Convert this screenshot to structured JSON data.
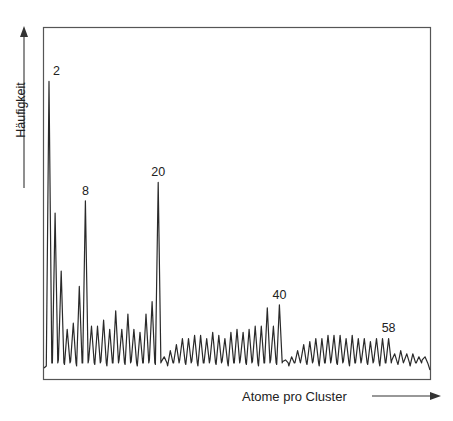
{
  "chart_data": {
    "type": "line",
    "title": "",
    "xlabel": "Atome pro Cluster",
    "ylabel": "Häufigkeit",
    "grid": false,
    "legend": null,
    "annotations": [
      {
        "label": "2",
        "note": "tallest peak at far left"
      },
      {
        "label": "8",
        "note": "magic-number peak"
      },
      {
        "label": "20",
        "note": "magic-number peak, followed by sharp drop"
      },
      {
        "label": "40",
        "note": "peak followed by drop"
      },
      {
        "label": "58",
        "note": "peak followed by drop"
      }
    ],
    "x_range": [
      1,
      66
    ],
    "y_range": [
      0,
      1
    ],
    "series": [
      {
        "name": "Häufigkeit",
        "description": "Relative abundance of clusters by number of atoms per cluster; pronounced peaks at 2, 8, 20, 40, 58",
        "x": [
          2,
          3,
          4,
          5,
          6,
          7,
          8,
          9,
          10,
          11,
          12,
          13,
          14,
          15,
          16,
          17,
          18,
          19,
          20,
          21,
          22,
          23,
          24,
          25,
          26,
          27,
          28,
          29,
          30,
          31,
          32,
          33,
          34,
          35,
          36,
          37,
          38,
          39,
          40,
          41,
          42,
          43,
          44,
          45,
          46,
          47,
          48,
          49,
          50,
          51,
          52,
          53,
          54,
          55,
          56,
          57,
          58,
          59,
          60,
          61,
          62,
          63,
          64
        ],
        "values": [
          0.93,
          0.5,
          0.31,
          0.12,
          0.14,
          0.26,
          0.54,
          0.13,
          0.13,
          0.15,
          0.12,
          0.18,
          0.12,
          0.17,
          0.12,
          0.11,
          0.17,
          0.21,
          0.6,
          0.03,
          0.05,
          0.07,
          0.09,
          0.09,
          0.1,
          0.1,
          0.09,
          0.11,
          0.1,
          0.09,
          0.11,
          0.12,
          0.11,
          0.12,
          0.13,
          0.13,
          0.19,
          0.13,
          0.2,
          0.02,
          0.03,
          0.05,
          0.07,
          0.08,
          0.09,
          0.09,
          0.1,
          0.1,
          0.1,
          0.09,
          0.1,
          0.09,
          0.09,
          0.08,
          0.09,
          0.09,
          0.09,
          0.04,
          0.05,
          0.04,
          0.04,
          0.03,
          0.03
        ]
      }
    ]
  },
  "axis": {
    "ylabel": "Häufigkeit",
    "xlabel": "Atome pro Cluster"
  }
}
